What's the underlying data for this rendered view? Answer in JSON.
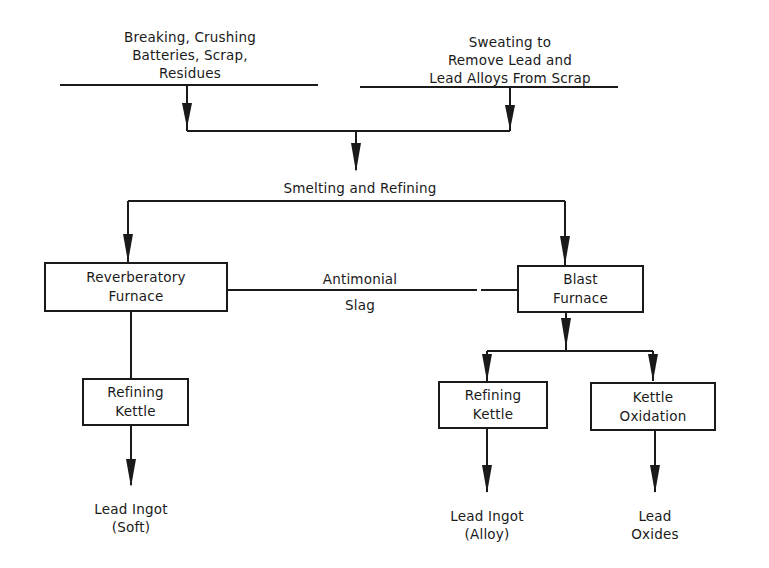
{
  "diagram": {
    "type": "process-flowchart",
    "inputs": [
      {
        "id": "breaking",
        "label": "Breaking, Crushing\nBatteries, Scrap,\nResidues"
      },
      {
        "id": "sweating",
        "label": "Sweating to\nRemove Lead and\nLead Alloys From Scrap"
      }
    ],
    "stage_label": "Smelting and Refining",
    "nodes": [
      {
        "id": "reverb",
        "label": "Reverberatory\nFurnace"
      },
      {
        "id": "blast",
        "label": "Blast\nFurnace"
      },
      {
        "id": "refining_left",
        "label": "Refining\nKettle"
      },
      {
        "id": "refining_right",
        "label": "Refining\nKettle"
      },
      {
        "id": "kettle_oxidation",
        "label": "Kettle\nOxidation"
      }
    ],
    "link_label_top": "Antimonial",
    "link_label_bottom": "Slag",
    "outputs": [
      {
        "id": "ingot_soft",
        "label": "Lead Ingot\n(Soft)"
      },
      {
        "id": "ingot_alloy",
        "label": "Lead Ingot\n(Alloy)"
      },
      {
        "id": "oxides",
        "label": "Lead\nOxides"
      }
    ],
    "edges": [
      [
        "breaking",
        "smelting"
      ],
      [
        "sweating",
        "smelting"
      ],
      [
        "smelting",
        "reverb"
      ],
      [
        "smelting",
        "blast"
      ],
      [
        "reverb",
        "blast",
        "Antimonial Slag"
      ],
      [
        "reverb",
        "refining_left"
      ],
      [
        "refining_left",
        "ingot_soft"
      ],
      [
        "blast",
        "refining_right"
      ],
      [
        "blast",
        "kettle_oxidation"
      ],
      [
        "refining_right",
        "ingot_alloy"
      ],
      [
        "kettle_oxidation",
        "oxides"
      ]
    ]
  }
}
